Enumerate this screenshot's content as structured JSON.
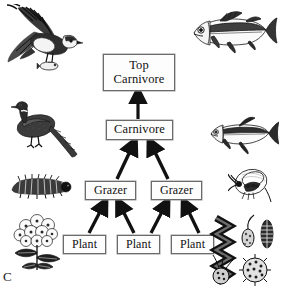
{
  "figure": {
    "panel_label": "C",
    "background_color": "#ffffff",
    "ink_color": "#111111",
    "box_border_color": "#6b6b6b",
    "style": "black-and-white scientific line illustration food web / trophic pyramid diagram"
  },
  "nodes": [
    {
      "id": "top-carnivore",
      "label": "Top\nCarnivore",
      "tier": "top carnivore",
      "x": 103,
      "y": 54,
      "w": 72,
      "h": 37
    },
    {
      "id": "carnivore",
      "label": "Carnivore",
      "tier": "carnivore",
      "x": 106,
      "y": 120,
      "w": 67,
      "h": 20
    },
    {
      "id": "grazer-left",
      "label": "Grazer",
      "tier": "grazer",
      "x": 85,
      "y": 181,
      "w": 51,
      "h": 19
    },
    {
      "id": "grazer-right",
      "label": "Grazer",
      "tier": "grazer",
      "x": 151,
      "y": 181,
      "w": 51,
      "h": 19
    },
    {
      "id": "plant-1",
      "label": "Plant",
      "tier": "producer",
      "x": 63,
      "y": 235,
      "w": 43,
      "h": 19
    },
    {
      "id": "plant-2",
      "label": "Plant",
      "tier": "producer",
      "x": 117,
      "y": 235,
      "w": 43,
      "h": 19
    },
    {
      "id": "plant-3",
      "label": "Plant",
      "tier": "producer",
      "x": 171,
      "y": 235,
      "w": 43,
      "h": 19
    }
  ],
  "arrows": [
    {
      "id": "arrow-carnivore-to-top",
      "from": "carnivore",
      "to": "top-carnivore",
      "direction": "up",
      "x1": 138,
      "y1": 119,
      "x2": 138,
      "y2": 93
    },
    {
      "id": "arrow-grazer-left-to-carnivore",
      "from": "grazer-left",
      "to": "carnivore",
      "direction": "up-right",
      "x1": 118,
      "y1": 179,
      "x2": 133,
      "y2": 143
    },
    {
      "id": "arrow-grazer-right-to-carnivore",
      "from": "grazer-right",
      "to": "carnivore",
      "direction": "up-left",
      "x1": 167,
      "y1": 179,
      "x2": 151,
      "y2": 143
    },
    {
      "id": "arrow-plant1-to-grazer-left",
      "from": "plant-1",
      "to": "grazer-left",
      "direction": "up-right",
      "x1": 90,
      "y1": 233,
      "x2": 104,
      "y2": 203
    },
    {
      "id": "arrow-plant2-to-grazer-left",
      "from": "plant-2",
      "to": "grazer-left",
      "direction": "up-left",
      "x1": 133,
      "y1": 233,
      "x2": 120,
      "y2": 203
    },
    {
      "id": "arrow-plant2-to-grazer-right",
      "from": "plant-2",
      "to": "grazer-right",
      "direction": "up-right",
      "x1": 152,
      "y1": 233,
      "x2": 166,
      "y2": 203
    },
    {
      "id": "arrow-plant3-to-grazer-right",
      "from": "plant-3",
      "to": "grazer-right",
      "direction": "up-left",
      "x1": 198,
      "y1": 233,
      "x2": 185,
      "y2": 203
    }
  ],
  "organisms": [
    {
      "id": "raptor",
      "name": "osprey-in-flight-with-fish",
      "side": "left",
      "tier": "top carnivore"
    },
    {
      "id": "predator-fish",
      "name": "large-predatory-fish",
      "side": "right",
      "tier": "top carnivore"
    },
    {
      "id": "pheasant",
      "name": "pheasant",
      "side": "left",
      "tier": "carnivore"
    },
    {
      "id": "forage-fish",
      "name": "forage-fish",
      "side": "right",
      "tier": "carnivore"
    },
    {
      "id": "caterpillar",
      "name": "caterpillar",
      "side": "left",
      "tier": "grazer"
    },
    {
      "id": "zooplankton",
      "name": "zooplankton-copepod",
      "side": "right",
      "tier": "grazer"
    },
    {
      "id": "flowering-plant",
      "name": "flowering-plant",
      "side": "left",
      "tier": "producer"
    },
    {
      "id": "algae",
      "name": "phytoplankton-algae-cluster",
      "side": "right",
      "tier": "producer"
    }
  ]
}
